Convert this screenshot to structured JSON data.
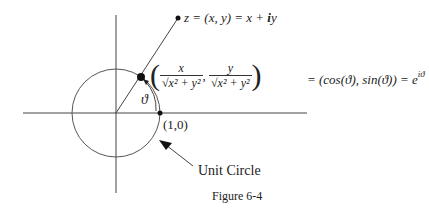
{
  "figure": {
    "caption": "Figure 6-4",
    "point_label": {
      "prefix": "z = (x, y) = x + ",
      "i": "i",
      "y": "y"
    },
    "coords": {
      "open_paren": "(",
      "close_paren": ")",
      "num_x": "x",
      "num_y": "y",
      "den": "√x² + y²",
      "comma": ","
    },
    "equality": {
      "text": "= (cos(ϑ), sin(ϑ)) = e",
      "exponent": "iϑ"
    },
    "angle_label": "ϑ",
    "unit_point_label": "(1,0)",
    "unit_circle_label": "Unit Circle"
  },
  "geometry": {
    "origin": [
      116,
      113
    ],
    "radius": 44,
    "angle_deg": 55,
    "z_point": [
      178,
      18
    ],
    "colors": {
      "stroke": "#444444",
      "point": "#111111"
    }
  }
}
